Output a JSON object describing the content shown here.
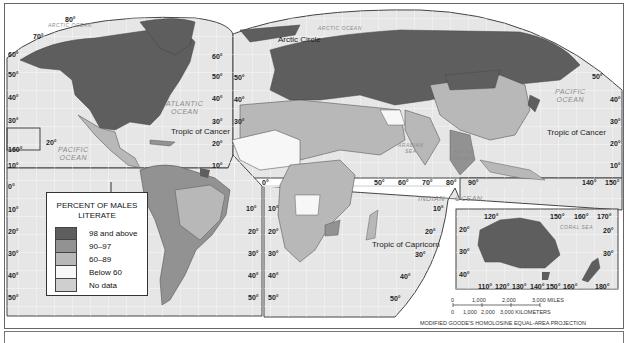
{
  "map": {
    "title": "Percent of Males Literate",
    "projection": "MODIFIED GOODE'S HOMOLOSINE EQUAL-AREA PROJECTION",
    "colors": {
      "ocean": "#e6e6e6",
      "grid": "#ffffff",
      "c98_above": "#5e5e5e",
      "c90_97": "#929292",
      "c60_89": "#b8b8b8",
      "below60": "#f7f7f7",
      "no_data": "#cfcfcf",
      "border": "#444444"
    },
    "oceans": {
      "arctic_left": "ARCTIC OCEAN",
      "arctic_right": "ARCTIC OCEAN",
      "atlantic": "ATLANTIC\nOCEAN",
      "pacific_left": "PACIFIC\nOCEAN",
      "pacific_right": "PACIFIC\nOCEAN",
      "indian_1": "INDIAN",
      "indian_2": "OCEAN",
      "arabian_sea": "ARABIAN\nSEA",
      "bay_of_bengal": "BAY OF\nBENGAL",
      "coral_sea": "CORAL SEA"
    },
    "lines": {
      "arctic_circle": "Arctic Circle",
      "tropic_cancer_left": "Tropic of Cancer",
      "tropic_cancer_right": "Tropic of Cancer",
      "tropic_capricorn": "Tropic of Capricorn"
    },
    "lat_labels_left": [
      "80°",
      "70°",
      "60°",
      "50°",
      "40°",
      "30°",
      "20°",
      "160°",
      "10°",
      "0°",
      "10°",
      "20°",
      "30°",
      "40°",
      "50°"
    ],
    "lat_labels_mid": [
      "60°",
      "50°",
      "40°",
      "30°",
      "20°",
      "10°",
      "10°",
      "20°",
      "30°",
      "40°",
      "50°"
    ],
    "lat_labels_africa": [
      "50°",
      "40°",
      "30°",
      "0°",
      "10°",
      "20°",
      "30°",
      "40°",
      "50°"
    ],
    "lat_labels_right": [
      "50°",
      "40°",
      "30°",
      "20°",
      "10°"
    ],
    "lon_labels_equator": [
      "50°",
      "60°",
      "70°",
      "80°",
      "90°",
      "140°",
      "150°"
    ],
    "lat_labels_indian": [
      "10°",
      "20°",
      "30°",
      "40°",
      "50°"
    ],
    "australia_inset": {
      "top_lon": [
        "120°",
        "150°",
        "160°",
        "170°"
      ],
      "bottom_lon": [
        "110°",
        "120°",
        "130°",
        "140°",
        "150°",
        "160°",
        "180°"
      ],
      "lat_left": [
        "20°",
        "30°",
        "40°"
      ],
      "lat_right": [
        "20°",
        "30°"
      ]
    }
  },
  "legend": {
    "title_line1": "PERCENT OF MALES",
    "title_line2": "LITERATE",
    "items": [
      {
        "label": "98 and above",
        "color": "#5e5e5e"
      },
      {
        "label": "90–97",
        "color": "#929292"
      },
      {
        "label": "60–89",
        "color": "#b8b8b8"
      },
      {
        "label": "Below 60",
        "color": "#f7f7f7"
      },
      {
        "label": "No data",
        "color": "#cfcfcf"
      }
    ]
  },
  "scale": {
    "miles": [
      "0",
      "1,000",
      "2,000",
      "3,000 MILES"
    ],
    "kilometers": [
      "0",
      "1,000",
      "2,000",
      "3,000 KILOMETERS"
    ]
  }
}
